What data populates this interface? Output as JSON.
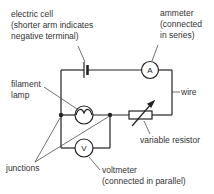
{
  "diagram": {
    "type": "circuit",
    "colors": {
      "wire": "#222222",
      "text": "#333333",
      "background": "#ffffff"
    },
    "labels": {
      "electric_cell": [
        "electric cell",
        "(shorter arm indicates",
        "negative terminal)"
      ],
      "ammeter": [
        "ammeter",
        "(connected",
        "in series)"
      ],
      "filament_lamp": [
        "filament",
        "lamp"
      ],
      "wire": "wire",
      "variable_resistor": "variable resistor",
      "junctions": "junctions",
      "voltmeter": [
        "voltmeter",
        "(connected in parallel)"
      ]
    },
    "symbols": {
      "ammeter": "A",
      "voltmeter": "V"
    }
  }
}
